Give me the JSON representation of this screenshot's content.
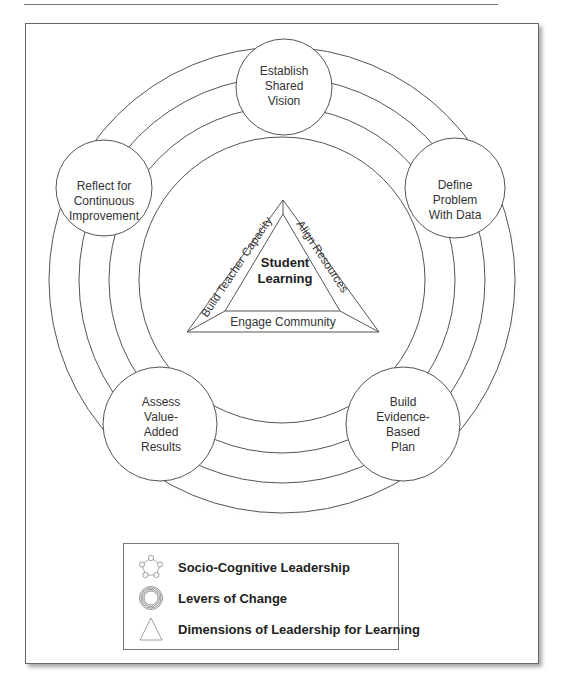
{
  "diagram": {
    "center": {
      "line1": "Student",
      "line2": "Learning"
    },
    "triangle_sides": {
      "left": "Build Teacher Capacity",
      "right": "Align Resources",
      "bottom": "Engage Community"
    },
    "rings": {
      "inner": "Individual",
      "middle": "Organization",
      "outer": "Community"
    },
    "nodes": [
      {
        "position": "top",
        "lines": [
          "Establish",
          "Shared",
          "Vision"
        ]
      },
      {
        "position": "upper-right",
        "lines": [
          "Define",
          "Problem",
          "With Data"
        ]
      },
      {
        "position": "lower-right",
        "lines": [
          "Build",
          "Evidence-",
          "Based",
          "Plan"
        ]
      },
      {
        "position": "lower-left",
        "lines": [
          "Assess",
          "Value-",
          "Added",
          "Results"
        ]
      },
      {
        "position": "upper-left",
        "lines": [
          "Reflect for",
          "Continuous",
          "Improvement"
        ]
      }
    ]
  },
  "legend": {
    "items": [
      {
        "icon": "pentagon-of-circles-icon",
        "label": "Socio-Cognitive Leadership"
      },
      {
        "icon": "concentric-circles-icon",
        "label": "Levers of Change"
      },
      {
        "icon": "triangle-icon",
        "label": "Dimensions of Leadership for Learning"
      }
    ]
  },
  "colors": {
    "stroke": "#555555",
    "text": "#222222",
    "background": "#ffffff"
  }
}
